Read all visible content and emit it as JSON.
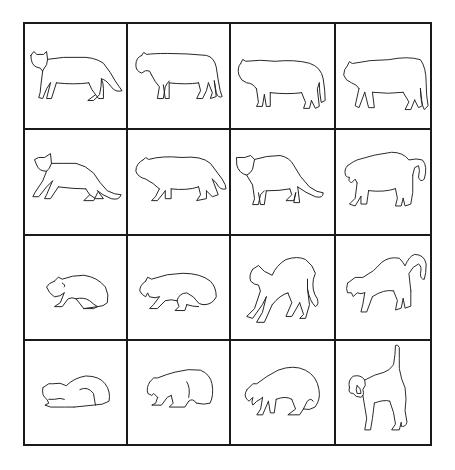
{
  "figure": {
    "rows": 4,
    "columns": 4,
    "cells": [
      {
        "row": 1,
        "col": 1,
        "posture": "standing-neutral"
      },
      {
        "row": 1,
        "col": 2,
        "posture": "standing-head-lowered"
      },
      {
        "row": 1,
        "col": 3,
        "posture": "standing-slightly-arched"
      },
      {
        "row": 1,
        "col": 4,
        "posture": "standing-tail-down"
      },
      {
        "row": 2,
        "col": 1,
        "posture": "crouching-walk"
      },
      {
        "row": 2,
        "col": 2,
        "posture": "low-stalking-walk"
      },
      {
        "row": 2,
        "col": 3,
        "posture": "standing-ears-back"
      },
      {
        "row": 2,
        "col": 4,
        "posture": "standing-mouth-open"
      },
      {
        "row": 3,
        "col": 1,
        "posture": "crouched-low"
      },
      {
        "row": 3,
        "col": 2,
        "posture": "crouched-hissing"
      },
      {
        "row": 3,
        "col": 3,
        "posture": "arched-back"
      },
      {
        "row": 3,
        "col": 4,
        "posture": "arched-back-hissing"
      },
      {
        "row": 4,
        "col": 1,
        "posture": "crouched-flattened"
      },
      {
        "row": 4,
        "col": 2,
        "posture": "crouched-defensive"
      },
      {
        "row": 4,
        "col": 3,
        "posture": "crouched-arched-hissing"
      },
      {
        "row": 4,
        "col": 4,
        "posture": "full-arch-tail-up-facing"
      }
    ]
  },
  "colors": {
    "line": "#222222",
    "grid": "#1a1a1a",
    "background": "#ffffff"
  }
}
